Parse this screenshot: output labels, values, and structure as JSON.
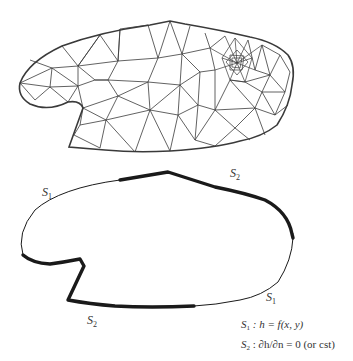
{
  "figure": {
    "top_panel": {
      "description": "Triangular finite-element mesh of the domain with local refinement"
    },
    "bottom_panel": {
      "description": "Domain boundary with boundary condition segments",
      "labels": {
        "s1_top_left": {
          "base": "S",
          "sub": "1"
        },
        "s2_top_right": {
          "base": "S",
          "sub": "2"
        },
        "s1_bottom_right": {
          "base": "S",
          "sub": "1"
        },
        "s2_bottom_left": {
          "base": "S",
          "sub": "2"
        }
      },
      "legend": {
        "line1": {
          "base": "S",
          "sub": "1",
          "rest": " : h = f(x, y)"
        },
        "line2": {
          "base": "S",
          "sub": "2",
          "rest": " : ∂h/∂n = 0 (or cst)"
        }
      }
    },
    "colors": {
      "line": "#333333",
      "background": "#ffffff"
    }
  }
}
